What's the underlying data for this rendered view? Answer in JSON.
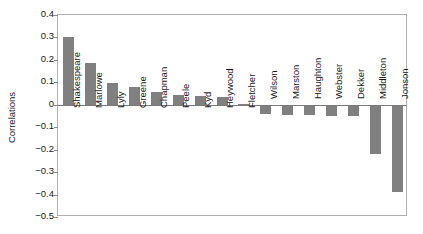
{
  "chart_data": {
    "type": "bar",
    "title": "",
    "subtitle": "",
    "xlabel": "",
    "ylabel": "Correlations",
    "ylim": [
      -0.5,
      0.4
    ],
    "yticks": [
      0.4,
      0.3,
      0.2,
      0.1,
      0,
      -0.1,
      -0.2,
      -0.3,
      -0.4,
      -0.5
    ],
    "ytick_labels": [
      "0.4",
      "0.3",
      "0.2",
      "0.1",
      "0",
      "−0.1",
      "−0.2",
      "−0.3",
      "−0.4",
      "−0.5"
    ],
    "grid": false,
    "legend": false,
    "bar_color": "#808080",
    "categories": [
      "Shakespeare",
      "Marlowe",
      "Lyly",
      "Greene",
      "Chapman",
      "Peele",
      "Kyd",
      "Heywood",
      "Fletcher",
      "Wilson",
      "Marston",
      "Haughton",
      "Webster",
      "Dekker",
      "Middleton",
      "Jonson"
    ],
    "values": [
      0.3,
      0.185,
      0.095,
      0.08,
      0.055,
      0.045,
      0.04,
      0.035,
      0.005,
      -0.04,
      -0.045,
      -0.045,
      -0.05,
      -0.05,
      -0.22,
      -0.39
    ]
  },
  "colors": {
    "bar": "#808080",
    "frame": "#b0b0b0",
    "axis_text": "#1a1a1a",
    "background": "#ffffff"
  }
}
